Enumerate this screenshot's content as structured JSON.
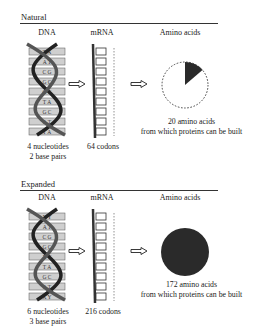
{
  "panels": [
    {
      "title": "Natural",
      "headers": {
        "dna": "DNA",
        "mrna": "mRNA",
        "amino": "Amino acids"
      },
      "dna_caption": [
        "4 nucleotides",
        "2 base pairs"
      ],
      "mrna_caption": "64 codons",
      "amino_caption": [
        "20 amino acids",
        "from which proteins can be built"
      ],
      "base_pairs": [
        "T A",
        "A T",
        "C G",
        "G C",
        "G C",
        "T A",
        "G C",
        "A T",
        "T A"
      ],
      "codon_letters": [
        "A",
        "U",
        "G",
        "C",
        "G",
        "U",
        "G",
        "A",
        "A"
      ],
      "amino_fraction": 0.15
    },
    {
      "title": "Expanded",
      "headers": {
        "dna": "DNA",
        "mrna": "mRNA",
        "amino": "Amino acids"
      },
      "dna_caption": [
        "6 nucleotides",
        "3 base pairs"
      ],
      "mrna_caption": "216 codons",
      "amino_caption": [
        "172 amino acids",
        "from which proteins can be built"
      ],
      "base_pairs": [
        "X Y",
        "A T",
        "C G",
        "G C",
        "X Y",
        "T A",
        "G C",
        "A T",
        "X Y"
      ],
      "codon_letters": [
        "X",
        "U",
        "G",
        "C",
        "Y",
        "U",
        "G",
        "A",
        "X"
      ],
      "amino_fraction": 1.0
    }
  ],
  "colors": {
    "ink": "#222222",
    "fill": "#2a2a2a",
    "rung": "#cfcfcf"
  }
}
